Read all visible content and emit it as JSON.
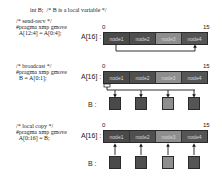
{
  "header": {
    "decl": "int B;  /* B is a local variable */"
  },
  "colors": {
    "node_dark": "#4a4a4a",
    "node_mid": "#575757",
    "node_light": "#8e8e8e",
    "wire": "#1a1a1a"
  },
  "sections": [
    {
      "id": "send-recv",
      "comment": "/* send-recv */",
      "pragma": "#pragma xmp gmove",
      "stmt": "  A[12:4] = A[0:4];",
      "array_label": "A[16] :",
      "idx_start": "0",
      "idx_end": "15",
      "nodes": [
        "node1",
        "node2",
        "node3",
        "node4"
      ]
    },
    {
      "id": "broadcast",
      "comment": "/* broadcast */",
      "pragma": "#pragma xmp gmove",
      "stmt": "  B = A[0:1];",
      "array_label": "A[16] :",
      "b_label": "B :",
      "idx_start": "0",
      "idx_end": "15",
      "nodes": [
        "node1",
        "node2",
        "node3",
        "node4"
      ]
    },
    {
      "id": "local-copy",
      "comment": "/* local copy */",
      "pragma": "#pragma xmp gmove",
      "stmt": "  A[0:16] = B;",
      "array_label": "A[16] :",
      "b_label": "B :",
      "idx_start": "0",
      "idx_end": "15",
      "nodes": [
        "node1",
        "node2",
        "node3",
        "node4"
      ]
    }
  ]
}
